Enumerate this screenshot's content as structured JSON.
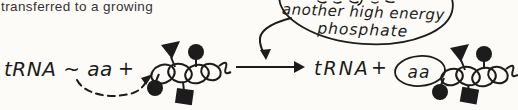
{
  "colors": {
    "background": "#fcfbf8",
    "ink": "#1c1c1c",
    "caption_text": "#333333"
  },
  "caption": {
    "text": "transferred to a growing"
  },
  "speech_bubble": {
    "line1": "another high energy",
    "line2": "phosphate"
  },
  "reaction": {
    "reactant_label": "tRNA ~ aa",
    "plus_left": "+",
    "product_label": "tRNA",
    "plus_right": "+",
    "circled_amino_acid": "aa"
  },
  "icons": {
    "amino_acid_circle": "filled-circle",
    "amino_acid_triangle": "filled-triangle",
    "amino_acid_square": "filled-square",
    "reaction_arrow": "right-arrow",
    "transfer_arrow": "dashed-curved-arrow",
    "phosphate_arrow": "curved-down-arrow"
  }
}
